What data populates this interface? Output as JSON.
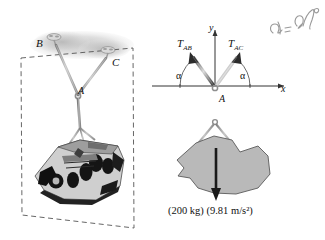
{
  "figure": {
    "background_color": "#ffffff"
  },
  "pictorial": {
    "name": "space-diagram",
    "points": {
      "B": "B",
      "C": "C",
      "A": "A"
    },
    "object": "engine-block",
    "plane_style": "dashed",
    "cable_color": "#8c8c8c",
    "plane_line_color": "#555555"
  },
  "free_body_diagram": {
    "name": "free-body-diagram",
    "axes": {
      "x_label": "x",
      "y_label": "y",
      "origin_label": "A",
      "axis_color": "#333333"
    },
    "forces": [
      {
        "id": "T_AB",
        "label_main": "T",
        "label_sub": "AB",
        "angle_label": "α",
        "direction": "up-left"
      },
      {
        "id": "T_AC",
        "label_main": "T",
        "label_sub": "AC",
        "angle_label": "α",
        "direction": "up-right"
      }
    ],
    "weight": {
      "label": "(200 kg) (9.81 m/s²)",
      "mass": "200 kg",
      "gravity": "9.81 m/s²",
      "direction": "down",
      "arrow_color": "#1a1a1a"
    },
    "body_fill": "#b9b9b9",
    "body_stroke": "#5a5a5a"
  },
  "annotation": {
    "name": "handwritten-note",
    "text": "α = 40°",
    "style": "handwritten",
    "color": "#9a9a9a"
  }
}
